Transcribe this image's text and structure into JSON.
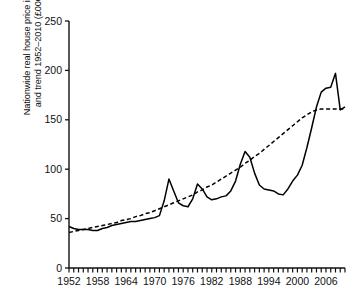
{
  "chart_data": {
    "type": "line",
    "title": "",
    "xlabel": "",
    "ylabel": "Nationwide real house price index\nand trend 1952–2010 (£000s)",
    "xlim": [
      1952,
      2010
    ],
    "ylim": [
      0,
      250
    ],
    "yticks": [
      0,
      50,
      100,
      150,
      200,
      250
    ],
    "ytick_labels": [
      "0",
      "50",
      "100",
      "150",
      "200",
      "250"
    ],
    "xticks": [
      1952,
      1958,
      1964,
      1970,
      1976,
      1982,
      1988,
      1994,
      2000,
      2006
    ],
    "xtick_labels": [
      "1952",
      "1958",
      "1964",
      "1970",
      "1976",
      "1982",
      "1988",
      "1994",
      "2000",
      "2006"
    ],
    "x_minor_tick_interval": 1,
    "grid": false,
    "legend": null,
    "x": [
      1952,
      1953,
      1954,
      1955,
      1956,
      1957,
      1958,
      1959,
      1960,
      1961,
      1962,
      1963,
      1964,
      1965,
      1966,
      1967,
      1968,
      1969,
      1970,
      1971,
      1972,
      1973,
      1974,
      1975,
      1976,
      1977,
      1978,
      1979,
      1980,
      1981,
      1982,
      1983,
      1984,
      1985,
      1986,
      1987,
      1988,
      1989,
      1990,
      1991,
      1992,
      1993,
      1994,
      1995,
      1996,
      1997,
      1998,
      1999,
      2000,
      2001,
      2002,
      2003,
      2004,
      2005,
      2006,
      2007,
      2008,
      2009,
      2010
    ],
    "series": [
      {
        "name": "Nationwide real house price index",
        "style": "solid",
        "color": "#000000",
        "values": [
          42,
          40,
          39,
          39,
          39,
          38,
          38,
          40,
          41,
          43,
          44,
          45,
          46,
          47,
          47,
          48,
          49,
          50,
          51,
          53,
          68,
          90,
          78,
          66,
          63,
          62,
          70,
          85,
          80,
          72,
          69,
          70,
          72,
          73,
          78,
          88,
          105,
          118,
          112,
          96,
          84,
          80,
          79,
          78,
          75,
          74,
          80,
          88,
          94,
          104,
          122,
          142,
          163,
          178,
          182,
          183,
          197,
          160,
          163
        ]
      },
      {
        "name": "Trend 1952–2010",
        "style": "dashed",
        "color": "#000000",
        "values": [
          36,
          37,
          38,
          39,
          40,
          41,
          42,
          43,
          44,
          45,
          46,
          48,
          49,
          50,
          52,
          53,
          55,
          56,
          58,
          60,
          62,
          64,
          66,
          68,
          70,
          72,
          74,
          77,
          79,
          82,
          84,
          87,
          90,
          93,
          96,
          99,
          102,
          106,
          109,
          113,
          116,
          120,
          124,
          128,
          132,
          136,
          140,
          144,
          148,
          152,
          155,
          158,
          160,
          161,
          161,
          161,
          161,
          161,
          161
        ]
      }
    ]
  }
}
